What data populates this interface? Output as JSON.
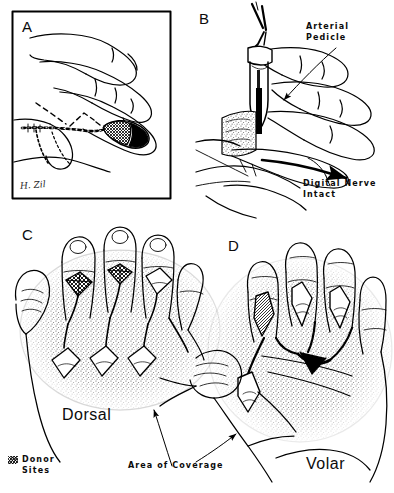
{
  "figure": {
    "background_color": "#ffffff",
    "ink_color": "#000000",
    "stipple_color": "#8a8a8a",
    "panels": [
      {
        "id": "A",
        "letter": "A",
        "caption": "Flap design on the radial side of the long finger with dashed incision outlines and cross-hatched donor area",
        "framed": true,
        "signature": "H. Zil"
      },
      {
        "id": "B",
        "letter": "B",
        "caption": "Flap elevated on its vascular pedicle, held with forceps, digital nerve preserved",
        "framed": false,
        "annotations": [
          {
            "name": "arterial-pedicle",
            "line1": "Arterial",
            "line2": "Pedicle"
          },
          {
            "name": "digital-nerve-intact",
            "line1": "Digital Nerve",
            "line2": "Intact"
          }
        ]
      },
      {
        "id": "C",
        "letter": "C",
        "caption": "Dorsal view of the hand showing donor sites and the stippled area of coverage",
        "framed": false,
        "region_label": "Dorsal"
      },
      {
        "id": "D",
        "letter": "D",
        "caption": "Volar view of the hand showing donor sites and the stippled area of coverage",
        "framed": false,
        "region_label": "Volar"
      }
    ],
    "shared_annotations": [
      {
        "name": "area-of-coverage",
        "text": "Area of Coverage"
      }
    ],
    "legend": {
      "name": "donor-sites-legend",
      "swatch_pattern": "cross-hatch",
      "line1": "Donor",
      "line2": "Sites"
    }
  }
}
